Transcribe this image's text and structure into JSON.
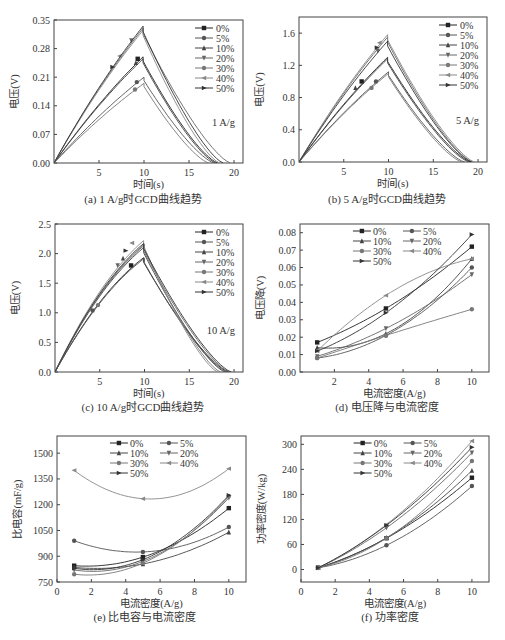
{
  "figure": {
    "line_color": "#333333",
    "frame_color": "#444444",
    "legend_labels": [
      "0%",
      "5%",
      "10%",
      "20%",
      "30%",
      "40%",
      "50%"
    ],
    "markers": [
      "square",
      "circle",
      "triangle-up",
      "triangle-down",
      "circle",
      "triangle-left",
      "triangle-right"
    ],
    "series_colors": [
      "#222222",
      "#555555",
      "#444444",
      "#666666",
      "#777777",
      "#888888",
      "#333333"
    ]
  },
  "chart_data": [
    {
      "id": "a",
      "type": "line",
      "title": "(a) 1 A/g时GCD曲线趋势",
      "xlabel": "时间(s)",
      "ylabel": "电压(V)",
      "annotation": "1 A/g",
      "xlim": [
        0,
        21
      ],
      "ylim": [
        0,
        0.35
      ],
      "xticks": [
        5,
        10,
        15,
        20
      ],
      "yticks": [
        0.0,
        0.07,
        0.14,
        0.21,
        0.28,
        0.35
      ],
      "ytick_labels": [
        "0.00",
        "0.07",
        "0.14",
        "0.21",
        "0.28",
        "0.35"
      ],
      "legend_position": "upper right",
      "legend_layout": "single-column",
      "series": [
        {
          "name": "0%",
          "peak_t": 9.9,
          "peak_v": 0.26,
          "end_t": 18.2,
          "marker_at": [
            9.3,
            0.255
          ]
        },
        {
          "name": "5%",
          "peak_t": 10.0,
          "peak_v": 0.21,
          "end_t": 17.8,
          "marker_at": [
            9.2,
            0.198
          ]
        },
        {
          "name": "10%",
          "peak_t": 9.9,
          "peak_v": 0.255,
          "end_t": 18.0,
          "marker_at": [
            9.1,
            0.245
          ]
        },
        {
          "name": "20%",
          "peak_t": 9.9,
          "peak_v": 0.33,
          "end_t": 19.6,
          "marker_at": [
            8.6,
            0.3
          ]
        },
        {
          "name": "30%",
          "peak_t": 10.0,
          "peak_v": 0.195,
          "end_t": 17.2,
          "marker_at": [
            9.0,
            0.18
          ]
        },
        {
          "name": "40%",
          "peak_t": 9.9,
          "peak_v": 0.325,
          "end_t": 18.4,
          "marker_at": [
            7.3,
            0.262
          ]
        },
        {
          "name": "50%",
          "peak_t": 9.9,
          "peak_v": 0.335,
          "end_t": 18.8,
          "marker_at": [
            6.5,
            0.235
          ]
        }
      ]
    },
    {
      "id": "b",
      "type": "line",
      "title": "(b) 5 A/g时GCD曲线趋势",
      "xlabel": "时间(s)",
      "ylabel": "电压(V)",
      "annotation": "5 A/g",
      "xlim": [
        0,
        21
      ],
      "ylim": [
        0,
        1.8
      ],
      "xticks": [
        5,
        10,
        15,
        20
      ],
      "yticks": [
        0.0,
        0.4,
        0.8,
        1.2,
        1.6
      ],
      "ytick_labels": [
        "0.0",
        "0.4",
        "0.8",
        "1.2",
        "1.6"
      ],
      "legend_position": "upper right",
      "legend_layout": "single-column",
      "series": [
        {
          "name": "0%",
          "peak_t": 9.9,
          "peak_v": 1.3,
          "end_t": 19.2,
          "marker_at": [
            7.0,
            1.0
          ]
        },
        {
          "name": "5%",
          "peak_t": 10.0,
          "peak_v": 1.12,
          "end_t": 18.5,
          "marker_at": [
            8.6,
            1.0
          ]
        },
        {
          "name": "10%",
          "peak_t": 9.9,
          "peak_v": 1.28,
          "end_t": 19.0,
          "marker_at": [
            6.3,
            0.92
          ]
        },
        {
          "name": "20%",
          "peak_t": 9.9,
          "peak_v": 1.55,
          "end_t": 19.4,
          "marker_at": [
            8.8,
            1.38
          ]
        },
        {
          "name": "30%",
          "peak_t": 10.0,
          "peak_v": 1.1,
          "end_t": 18.2,
          "marker_at": [
            8.1,
            0.92
          ]
        },
        {
          "name": "40%",
          "peak_t": 9.9,
          "peak_v": 1.58,
          "end_t": 19.6,
          "marker_at": [
            9.0,
            1.48
          ]
        },
        {
          "name": "50%",
          "peak_t": 9.9,
          "peak_v": 1.5,
          "end_t": 19.3,
          "marker_at": [
            8.7,
            1.42
          ]
        }
      ]
    },
    {
      "id": "c",
      "type": "line",
      "title": "(c) 10 A/g时GCD曲线趋势",
      "xlabel": "时间(s)",
      "ylabel": "电压(V)",
      "annotation": "10 A/g",
      "xlim": [
        0,
        21
      ],
      "ylim": [
        0,
        2.5
      ],
      "xticks": [
        5,
        10,
        15,
        20
      ],
      "yticks": [
        0.0,
        0.5,
        1.0,
        1.5,
        2.0,
        2.5
      ],
      "ytick_labels": [
        "0.0",
        "0.5",
        "1.0",
        "1.5",
        "2.0",
        "2.5"
      ],
      "legend_position": "upper right",
      "legend_layout": "single-column",
      "series": [
        {
          "name": "0%",
          "peak_t": 9.9,
          "peak_v": 1.93,
          "end_t": 19.4,
          "marker_at": [
            8.5,
            1.8
          ]
        },
        {
          "name": "5%",
          "peak_t": 10.0,
          "peak_v": 1.92,
          "end_t": 19.2,
          "marker_at": [
            4.2,
            1.04
          ]
        },
        {
          "name": "10%",
          "peak_t": 9.9,
          "peak_v": 2.1,
          "end_t": 19.0,
          "marker_at": [
            7.6,
            1.92
          ]
        },
        {
          "name": "20%",
          "peak_t": 9.9,
          "peak_v": 2.13,
          "end_t": 19.5,
          "marker_at": [
            7.0,
            1.8
          ]
        },
        {
          "name": "30%",
          "peak_t": 10.0,
          "peak_v": 2.16,
          "end_t": 18.5,
          "marker_at": [
            4.8,
            1.13
          ]
        },
        {
          "name": "40%",
          "peak_t": 9.9,
          "peak_v": 2.22,
          "end_t": 18.2,
          "marker_at": [
            8.6,
            2.18
          ]
        },
        {
          "name": "50%",
          "peak_t": 9.9,
          "peak_v": 2.17,
          "end_t": 19.7,
          "marker_at": [
            7.9,
            2.05
          ]
        }
      ]
    },
    {
      "id": "d",
      "type": "line",
      "title": "(d) 电压降与电流密度",
      "xlabel": "电流密度(A/g)",
      "ylabel": "电压降(V)",
      "xlim": [
        0,
        11
      ],
      "ylim": [
        0,
        0.085
      ],
      "xticks": [
        2,
        4,
        6,
        8,
        10
      ],
      "yticks": [
        0.0,
        0.01,
        0.02,
        0.03,
        0.04,
        0.05,
        0.06,
        0.07,
        0.08
      ],
      "ytick_labels": [
        "0.00",
        "0.01",
        "0.02",
        "0.03",
        "0.04",
        "0.05",
        "0.06",
        "0.07",
        "0.08"
      ],
      "legend_position": "upper center",
      "legend_layout": "two-column",
      "x": [
        1,
        5,
        10
      ],
      "series": [
        {
          "name": "0%",
          "values": [
            0.017,
            0.0365,
            0.072
          ]
        },
        {
          "name": "5%",
          "values": [
            0.008,
            0.021,
            0.06
          ]
        },
        {
          "name": "10%",
          "values": [
            0.014,
            0.022,
            0.065
          ]
        },
        {
          "name": "20%",
          "values": [
            0.009,
            0.025,
            0.056
          ]
        },
        {
          "name": "30%",
          "values": [
            0.008,
            0.021,
            0.036
          ]
        },
        {
          "name": "40%",
          "values": [
            0.012,
            0.044,
            0.065
          ]
        },
        {
          "name": "50%",
          "values": [
            0.012,
            0.034,
            0.079
          ]
        }
      ]
    },
    {
      "id": "e",
      "type": "line",
      "title": "(e) 比电容与电流密度",
      "xlabel": "电流密度(A/g)",
      "ylabel": "比电容(mF/g)",
      "xlim": [
        0,
        11
      ],
      "ylim": [
        750,
        1600
      ],
      "xticks": [
        0,
        2,
        4,
        6,
        8,
        10
      ],
      "yticks": [
        750,
        900,
        1050,
        1200,
        1350,
        1500
      ],
      "ytick_labels": [
        "750",
        "900",
        "1050",
        "1200",
        "1350",
        "1500"
      ],
      "legend_position": "upper center",
      "legend_layout": "two-column",
      "x": [
        1,
        5,
        10
      ],
      "series": [
        {
          "name": "0%",
          "values": [
            845,
            895,
            1180
          ]
        },
        {
          "name": "5%",
          "values": [
            990,
            925,
            1070
          ]
        },
        {
          "name": "10%",
          "values": [
            835,
            855,
            1040
          ]
        },
        {
          "name": "20%",
          "values": [
            820,
            870,
            1240
          ]
        },
        {
          "name": "30%",
          "values": [
            795,
            860,
            1250
          ]
        },
        {
          "name": "40%",
          "values": [
            1400,
            1235,
            1410
          ]
        },
        {
          "name": "50%",
          "values": [
            830,
            880,
            1255
          ]
        }
      ]
    },
    {
      "id": "f",
      "type": "line",
      "title": "(f) 功率密度",
      "xlabel": "电流密度(A/g)",
      "ylabel": "功率密度(W/kg)",
      "xlim": [
        0,
        11
      ],
      "ylim": [
        -30,
        320
      ],
      "xticks": [
        0,
        2,
        4,
        6,
        8,
        10
      ],
      "yticks": [
        0,
        60,
        120,
        180,
        240,
        300
      ],
      "ytick_labels": [
        "0",
        "60",
        "120",
        "180",
        "240",
        "300"
      ],
      "legend_position": "upper center",
      "legend_layout": "two-column",
      "x": [
        1,
        5,
        10
      ],
      "series": [
        {
          "name": "0%",
          "values": [
            4,
            75,
            220
          ]
        },
        {
          "name": "5%",
          "values": [
            4,
            58,
            200
          ]
        },
        {
          "name": "10%",
          "values": [
            4,
            76,
            237
          ]
        },
        {
          "name": "20%",
          "values": [
            4,
            100,
            280
          ]
        },
        {
          "name": "30%",
          "values": [
            4,
            75,
            260
          ]
        },
        {
          "name": "40%",
          "values": [
            4,
            108,
            308
          ]
        },
        {
          "name": "50%",
          "values": [
            4,
            106,
            293
          ]
        }
      ]
    }
  ]
}
